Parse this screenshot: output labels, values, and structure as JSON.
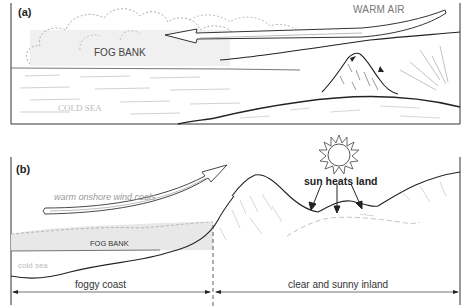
{
  "figure": {
    "panel_a": {
      "label": "(a)",
      "labels": {
        "warm_air": "WARM AIR",
        "fog_bank": "FOG BANK",
        "cold_sea": "COLD SEA"
      }
    },
    "panel_b": {
      "label": "(b)",
      "labels": {
        "warm_wind": "warm onshore wind cools",
        "fog_bank": "FOG BANK",
        "cold_sea": "cold sea",
        "sun_heats_land": "sun heats land"
      },
      "zones": {
        "foggy_coast": "foggy coast",
        "clear_inland": "clear and sunny inland"
      }
    },
    "colors": {
      "ink": "#222222",
      "fog": "#e6e6e6",
      "faint_text": "#bbbbbb"
    }
  }
}
